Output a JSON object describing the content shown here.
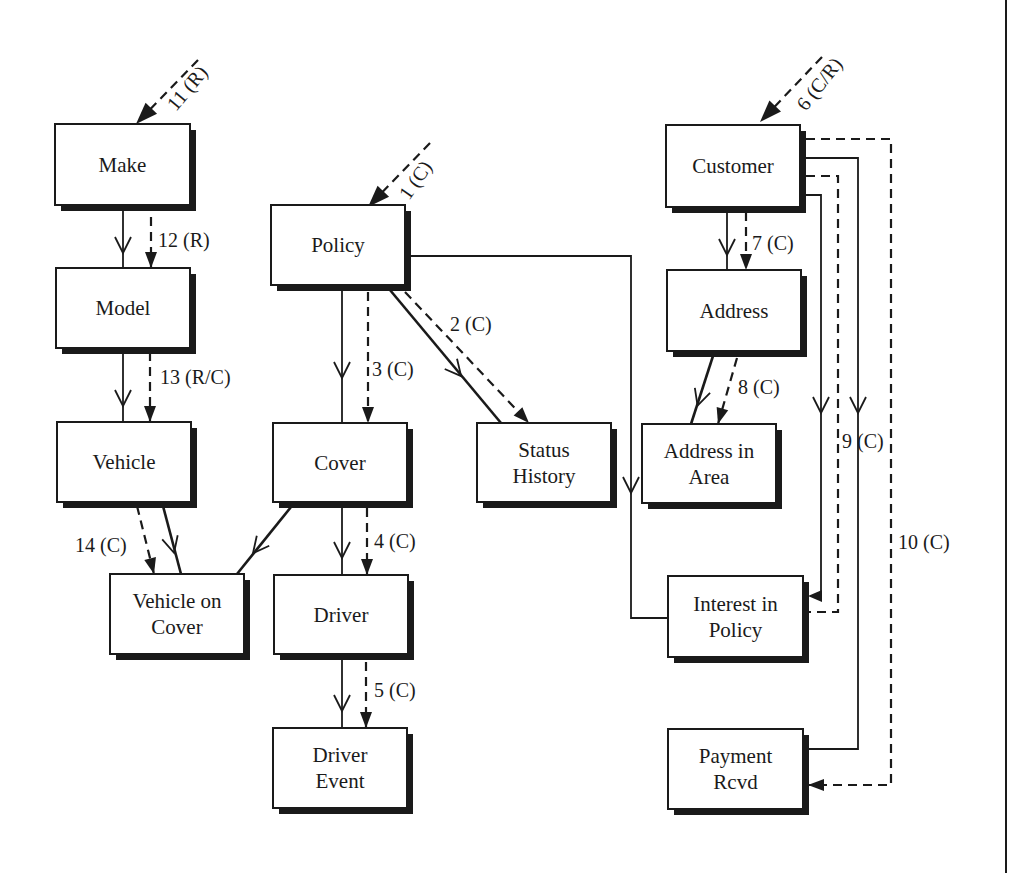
{
  "diagram": {
    "type": "entity-life-history / data-flow diagram",
    "shadow_offset": 6,
    "colors": {
      "ink": "#1a1a1a",
      "background": "#ffffff"
    },
    "entities": [
      {
        "id": "make",
        "lines": [
          "Make"
        ],
        "x": 55,
        "y": 124,
        "w": 135,
        "h": 81
      },
      {
        "id": "model",
        "lines": [
          "Model"
        ],
        "x": 56,
        "y": 268,
        "w": 134,
        "h": 80
      },
      {
        "id": "vehicle",
        "lines": [
          "Vehicle"
        ],
        "x": 57,
        "y": 422,
        "w": 134,
        "h": 80
      },
      {
        "id": "vehicle-on-cover",
        "lines": [
          "Vehicle on",
          "Cover"
        ],
        "x": 110,
        "y": 574,
        "w": 134,
        "h": 80
      },
      {
        "id": "policy",
        "lines": [
          "Policy"
        ],
        "x": 271,
        "y": 205,
        "w": 134,
        "h": 80
      },
      {
        "id": "cover",
        "lines": [
          "Cover"
        ],
        "x": 273,
        "y": 423,
        "w": 134,
        "h": 79
      },
      {
        "id": "driver",
        "lines": [
          "Driver"
        ],
        "x": 274,
        "y": 575,
        "w": 134,
        "h": 79
      },
      {
        "id": "driver-event",
        "lines": [
          "Driver",
          "Event"
        ],
        "x": 273,
        "y": 728,
        "w": 134,
        "h": 80
      },
      {
        "id": "status-history",
        "lines": [
          "Status",
          "History"
        ],
        "x": 477,
        "y": 423,
        "w": 134,
        "h": 79
      },
      {
        "id": "customer",
        "lines": [
          "Customer"
        ],
        "x": 666,
        "y": 125,
        "w": 134,
        "h": 82
      },
      {
        "id": "address",
        "lines": [
          "Address"
        ],
        "x": 667,
        "y": 270,
        "w": 134,
        "h": 81
      },
      {
        "id": "address-in-area",
        "lines": [
          "Address in",
          "Area"
        ],
        "x": 642,
        "y": 424,
        "w": 134,
        "h": 79
      },
      {
        "id": "interest-in-policy",
        "lines": [
          "Interest in",
          "Policy"
        ],
        "x": 668,
        "y": 576,
        "w": 135,
        "h": 81
      },
      {
        "id": "payment-rcvd",
        "lines": [
          "Payment",
          "Rcvd"
        ],
        "x": 668,
        "y": 729,
        "w": 135,
        "h": 80
      }
    ],
    "entry_arrows": [
      {
        "id": "11",
        "label": "11 (R)",
        "from": [
          198,
          60
        ],
        "to": [
          136,
          124
        ],
        "label_pos": [
          176,
          112
        ],
        "label_rot": -50
      },
      {
        "id": "1",
        "label": "1 (C)",
        "from": [
          430,
          143
        ],
        "to": [
          368,
          207
        ],
        "label_pos": [
          409,
          201
        ],
        "label_rot": -55
      },
      {
        "id": "6",
        "label": "6 (C/R)",
        "from": [
          822,
          57
        ],
        "to": [
          760,
          122
        ],
        "label_pos": [
          806,
          112
        ],
        "label_rot": -52
      }
    ],
    "relationships": [
      {
        "from": "make",
        "to": "model",
        "style": "solid",
        "points": [
          [
            123,
            205
          ],
          [
            123,
            268
          ]
        ],
        "crow": [
          123,
          245
        ]
      },
      {
        "from": "model",
        "to": "vehicle",
        "style": "solid",
        "points": [
          [
            123,
            348
          ],
          [
            123,
            422
          ]
        ],
        "crow": [
          123,
          398
        ]
      },
      {
        "from": "vehicle",
        "to": "vehicle-on-cover",
        "style": "solid-thick",
        "points": [
          [
            163,
            506
          ],
          [
            181,
            574
          ]
        ],
        "crow": [
          172,
          545
        ]
      },
      {
        "from": "cover",
        "to": "vehicle-on-cover",
        "style": "solid-thick",
        "points": [
          [
            291,
            507
          ],
          [
            237,
            574
          ]
        ],
        "crow": [
          258,
          547
        ]
      },
      {
        "from": "policy",
        "to": "cover",
        "style": "solid",
        "points": [
          [
            342,
            290
          ],
          [
            342,
            423
          ]
        ],
        "crow": [
          342,
          370
        ]
      },
      {
        "from": "cover",
        "to": "driver",
        "style": "solid",
        "points": [
          [
            342,
            507
          ],
          [
            342,
            575
          ]
        ],
        "crow": [
          342,
          550
        ]
      },
      {
        "from": "driver",
        "to": "driver-event",
        "style": "solid",
        "points": [
          [
            342,
            659
          ],
          [
            342,
            728
          ]
        ],
        "crow": [
          342,
          703
        ]
      },
      {
        "from": "policy",
        "to": "status-history",
        "style": "solid-thick",
        "points": [
          [
            390,
            290
          ],
          [
            501,
            423
          ]
        ],
        "crow": [
          456,
          370
        ]
      },
      {
        "from": "policy",
        "to": "interest-in-policy",
        "style": "solid",
        "points": [
          [
            411,
            256
          ],
          [
            631,
            256
          ],
          [
            631,
            618
          ],
          [
            668,
            618
          ]
        ],
        "crow": [
          631,
          485
        ]
      },
      {
        "from": "customer",
        "to": "address",
        "style": "solid",
        "points": [
          [
            727,
            212
          ],
          [
            727,
            270
          ]
        ],
        "crow": [
          727,
          247
        ]
      },
      {
        "from": "address",
        "to": "address-in-area",
        "style": "solid-thick",
        "points": [
          [
            713,
            356
          ],
          [
            691,
            424
          ]
        ],
        "crow": [
          700,
          398
        ]
      },
      {
        "from": "customer",
        "to": "interest-in-policy",
        "style": "solid",
        "points": [
          [
            806,
            195
          ],
          [
            821,
            195
          ],
          [
            821,
            594
          ]
        ],
        "crow": [
          821,
          405
        ]
      },
      {
        "from": "customer",
        "to": "payment-rcvd",
        "style": "solid",
        "points": [
          [
            806,
            158
          ],
          [
            858,
            158
          ],
          [
            858,
            749
          ],
          [
            808,
            749
          ]
        ],
        "crow": [
          858,
          405
        ]
      }
    ],
    "events": [
      {
        "label": "12 (R)",
        "points": [
          [
            151,
            217
          ],
          [
            151,
            268
          ]
        ],
        "arrow_end": [
          151,
          268
        ],
        "label_pos": [
          158,
          247
        ]
      },
      {
        "label": "13 (R/C)",
        "points": [
          [
            150,
            352
          ],
          [
            150,
            422
          ]
        ],
        "arrow_end": [
          150,
          422
        ],
        "label_pos": [
          160,
          384
        ]
      },
      {
        "label": "14 (C)",
        "points": [
          [
            137,
            506
          ],
          [
            154,
            574
          ]
        ],
        "arrow_end": [
          154,
          574
        ],
        "label_pos": [
          75,
          552
        ]
      },
      {
        "label": "3 (C)",
        "points": [
          [
            368,
            292
          ],
          [
            368,
            423
          ]
        ],
        "arrow_end": [
          368,
          423
        ],
        "label_pos": [
          372,
          376
        ]
      },
      {
        "label": "4 (C)",
        "points": [
          [
            367,
            508
          ],
          [
            367,
            575
          ]
        ],
        "arrow_end": [
          367,
          575
        ],
        "label_pos": [
          374,
          548
        ]
      },
      {
        "label": "5 (C)",
        "points": [
          [
            366,
            662
          ],
          [
            366,
            728
          ]
        ],
        "arrow_end": [
          366,
          728
        ],
        "label_pos": [
          374,
          697
        ]
      },
      {
        "label": "2 (C)",
        "points": [
          [
            405,
            292
          ],
          [
            529,
            423
          ]
        ],
        "arrow_end": [
          529,
          423
        ],
        "label_pos": [
          450,
          331
        ]
      },
      {
        "label": "7 (C)",
        "points": [
          [
            746,
            212
          ],
          [
            746,
            270
          ]
        ],
        "arrow_end": [
          746,
          270
        ],
        "label_pos": [
          752,
          250
        ]
      },
      {
        "label": "8 (C)",
        "points": [
          [
            737,
            358
          ],
          [
            718,
            424
          ]
        ],
        "arrow_end": [
          718,
          424
        ],
        "label_pos": [
          738,
          394
        ]
      },
      {
        "label": "9 (C)",
        "points": [
          [
            806,
            176
          ],
          [
            838,
            176
          ],
          [
            838,
            612
          ],
          [
            808,
            612
          ]
        ],
        "arrow_end": null,
        "label_pos": [
          842,
          448
        ]
      },
      {
        "label": "10 (C)",
        "points": [
          [
            806,
            139
          ],
          [
            891,
            139
          ],
          [
            891,
            785
          ],
          [
            808,
            785
          ]
        ],
        "arrow_end": [
          808,
          785
        ],
        "label_pos": [
          898,
          549
        ]
      }
    ],
    "interest_arrow": {
      "to": [
        808,
        596
      ],
      "from": [
        826,
        596
      ]
    },
    "frame": {
      "right_border_x": 1006,
      "y1": 0,
      "y2": 873
    }
  }
}
